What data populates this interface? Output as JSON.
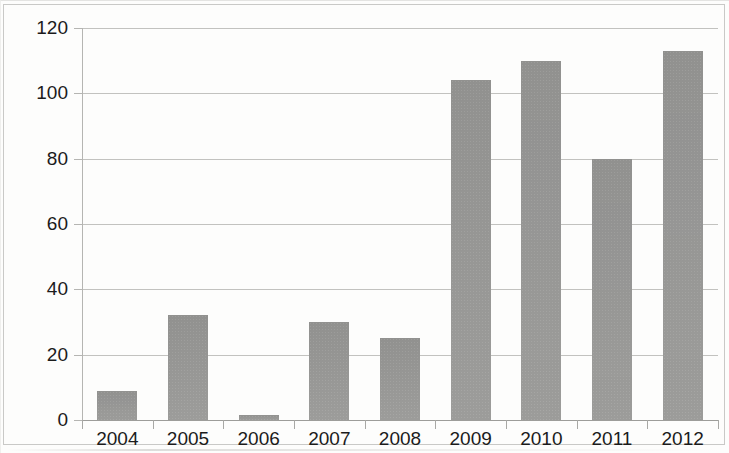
{
  "chart_data": {
    "type": "bar",
    "title": "",
    "subtitle": "",
    "xlabel": "",
    "ylabel": "",
    "categories": [
      "2004",
      "2005",
      "2006",
      "2007",
      "2008",
      "2009",
      "2010",
      "2011",
      "2012"
    ],
    "values": [
      9,
      32,
      1.5,
      30,
      25,
      104,
      110,
      80,
      113
    ],
    "series": [
      {
        "name": "",
        "values": [
          9,
          32,
          1.5,
          30,
          25,
          104,
          110,
          80,
          113
        ]
      }
    ],
    "ylim": [
      0,
      120
    ],
    "y_ticks": [
      0,
      20,
      40,
      60,
      80,
      100,
      120
    ],
    "y_tick_labels": [
      "0",
      "20",
      "40",
      "60",
      "80",
      "100",
      "120"
    ],
    "grid": true,
    "grid_axis": "y",
    "legend": false,
    "legend_position": "none",
    "bar_color": "#979795",
    "gridline_color": "#b7b7b4",
    "axis_color": "#9d9d9a",
    "text_color": "#1b1b1b",
    "background_color": "#fdfdfc",
    "annotations": []
  }
}
